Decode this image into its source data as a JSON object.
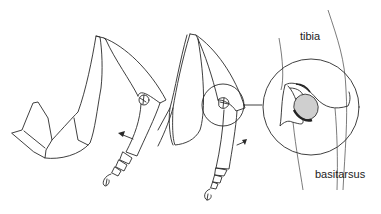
{
  "figure": {
    "type": "anatomical line drawing",
    "panels": [
      {
        "id": "leg-1",
        "description": "leg with tarsus flexed, arrow indicating movement"
      },
      {
        "id": "leg-2",
        "description": "leg with tarsus extended, joint circled"
      },
      {
        "id": "detail",
        "description": "magnified view of tibia-basitarsus joint"
      }
    ],
    "labels": {
      "tibia": "tibia",
      "basitarsus": "basitarsus"
    },
    "colors": {
      "line": "#2a2a2a",
      "background": "#ffffff",
      "shading": "#555555"
    }
  }
}
